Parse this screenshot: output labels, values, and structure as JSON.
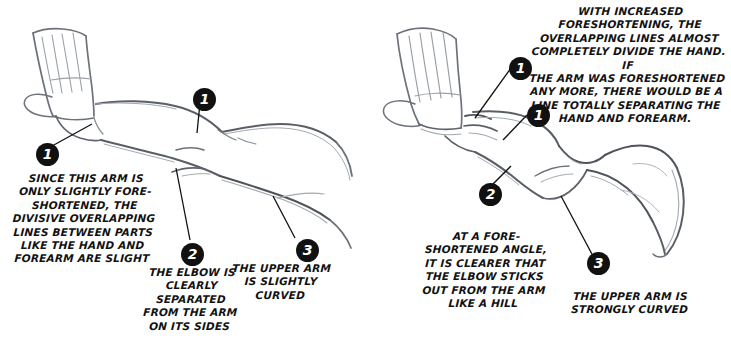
{
  "figure": {
    "ink_color": "#111111",
    "pencil_color": "#7b7f86",
    "background": "#ffffff"
  },
  "panels": [
    {
      "id": "left",
      "name": "slightly-foreshortened-arm",
      "badges": [
        {
          "label": "1",
          "x": 36,
          "y": 143
        },
        {
          "label": "1",
          "x": 193,
          "y": 88
        },
        {
          "label": "2",
          "x": 181,
          "y": 243
        },
        {
          "label": "3",
          "x": 296,
          "y": 239
        }
      ],
      "captions": [
        {
          "name": "caption-left-main",
          "text": "SINCE THIS ARM IS\nONLY SLIGHTLY FORE-\nSHORTENED, THE\nDIVISIVE OVERLAPPING\nLINES BETWEEN PARTS\nLIKE THE HAND AND\nFOREARM ARE SLIGHT",
          "x": 4,
          "y": 172,
          "width": 160
        },
        {
          "name": "caption-left-elbow",
          "text": "THE ELBOW IS\nCLEARLY\nSEPARATED\nFROM THE ARM\nON ITS SIDES",
          "x": 136,
          "y": 266,
          "width": 110
        },
        {
          "name": "caption-left-upper-arm",
          "text": "THE UPPER ARM\nIS SLIGHTLY\nCURVED",
          "x": 231,
          "y": 262,
          "width": 100
        }
      ]
    },
    {
      "id": "right",
      "name": "strongly-foreshortened-arm",
      "badges": [
        {
          "label": "1",
          "x": 509,
          "y": 57
        },
        {
          "label": "1",
          "x": 527,
          "y": 104
        },
        {
          "label": "2",
          "x": 479,
          "y": 183
        },
        {
          "label": "3",
          "x": 587,
          "y": 252
        }
      ],
      "captions": [
        {
          "name": "caption-right-main",
          "text": "WITH INCREASED\nFORESHORTENING, THE\nOVERLAPPING LINES ALMOST\nCOMPLETELY DIVIDE THE HAND. IF\nTHE ARM WAS FORESHORTENED\nANY MORE, THERE WOULD BE A\nLINE TOTALLY SEPARATING THE\nHAND AND FOREARM.",
          "x": 528,
          "y": 5,
          "width": 200
        },
        {
          "name": "caption-right-elbow",
          "text": "AT A FORE-\nSHORTENED ANGLE,\nIT IS CLEARER THAT\nTHE ELBOW STICKS\nOUT FROM THE ARM\nLIKE A HILL",
          "x": 420,
          "y": 230,
          "width": 130
        },
        {
          "name": "caption-right-upper-arm",
          "text": "THE UPPER ARM IS\nSTRONGLY CURVED",
          "x": 560,
          "y": 290,
          "width": 140
        }
      ]
    }
  ]
}
